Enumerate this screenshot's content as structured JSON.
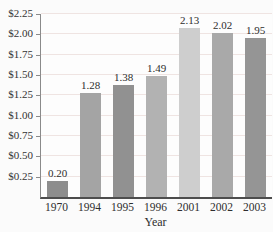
{
  "chart_data": {
    "type": "bar",
    "title": "",
    "xlabel": "Year",
    "ylabel": "",
    "categories": [
      "1970",
      "1994",
      "1995",
      "1996",
      "2001",
      "2002",
      "2003"
    ],
    "values": [
      0.2,
      1.28,
      1.38,
      1.49,
      2.13,
      2.02,
      1.95
    ],
    "value_labels": [
      "0.20",
      "1.28",
      "1.38",
      "1.49",
      "2.13",
      "2.02",
      "1.95"
    ],
    "bar_colors": [
      "#8d8d8d",
      "#a4a4a4",
      "#919191",
      "#b2b2b2",
      "#cecece",
      "#a9a9a9",
      "#959595"
    ],
    "ylim": [
      0,
      2.25
    ],
    "yticks": [
      0.25,
      0.5,
      0.75,
      1.0,
      1.25,
      1.5,
      1.75,
      2.0,
      2.25
    ],
    "ytick_labels": [
      "$0.25",
      "$0.50",
      "$0.75",
      "$1.00",
      "$1.25",
      "$1.50",
      "$1.75",
      "$2.00",
      "$2.25"
    ],
    "grid": true,
    "legend": "none"
  },
  "colors": {
    "grid": "#efe4e2",
    "axis": "#8a8a8a",
    "text": "#2e2e2e",
    "background": "#fbfbfb"
  }
}
